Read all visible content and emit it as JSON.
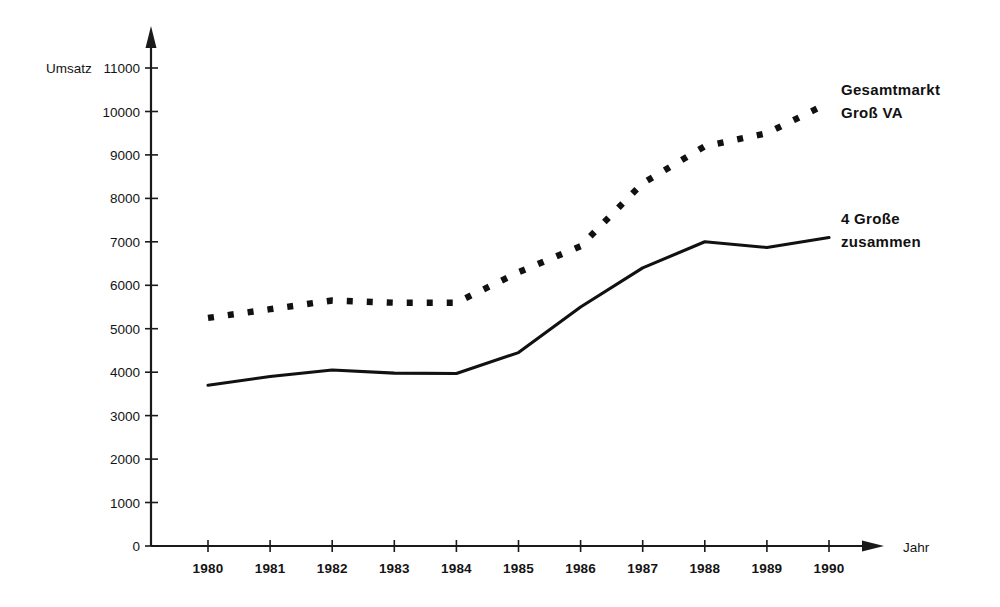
{
  "chart_data": {
    "type": "line",
    "title": "",
    "xlabel": "Jahr",
    "ylabel": "Umsatz",
    "x": [
      1980,
      1981,
      1982,
      1983,
      1984,
      1985,
      1986,
      1987,
      1988,
      1989,
      1990
    ],
    "xtick_labels": [
      "1980",
      "1981",
      "1982",
      "1983",
      "1984",
      "1985",
      "1986",
      "1987",
      "1988",
      "1989",
      "1990"
    ],
    "ytick_labels": [
      "0",
      "1000",
      "2000",
      "3000",
      "4000",
      "5000",
      "6000",
      "7000",
      "8000",
      "9000",
      "10000",
      "11000"
    ],
    "ytick_values": [
      0,
      1000,
      2000,
      3000,
      4000,
      5000,
      6000,
      7000,
      8000,
      9000,
      10000,
      11000
    ],
    "ylim": [
      0,
      11000
    ],
    "xlim": [
      1980,
      1990
    ],
    "grid": false,
    "legend_position": "right-inline-annotations",
    "series": [
      {
        "name": "Gesamtmarkt Groß VA",
        "style": "dotted",
        "label_line1": "Gesamtmarkt",
        "label_line2": "Groß VA",
        "color": "#111111",
        "values": [
          5250,
          5450,
          5650,
          5600,
          5600,
          6300,
          6900,
          8350,
          9200,
          9500,
          10200
        ]
      },
      {
        "name": "4 Große zusammen",
        "style": "solid",
        "label_line1": "4 Große",
        "label_line2": "zusammen",
        "color": "#111111",
        "values": [
          3700,
          3900,
          4050,
          3980,
          3970,
          4450,
          5500,
          6400,
          7000,
          6870,
          7100
        ]
      }
    ]
  },
  "axes": {
    "y_axis_title": "Umsatz",
    "x_axis_title": "Jahr"
  },
  "annotations": {
    "top_series_line1": "Gesamtmarkt",
    "top_series_line2": "Groß VA",
    "bottom_series_line1": "4 Große",
    "bottom_series_line2": "zusammen"
  },
  "colors": {
    "ink": "#111111",
    "background": "#ffffff"
  }
}
